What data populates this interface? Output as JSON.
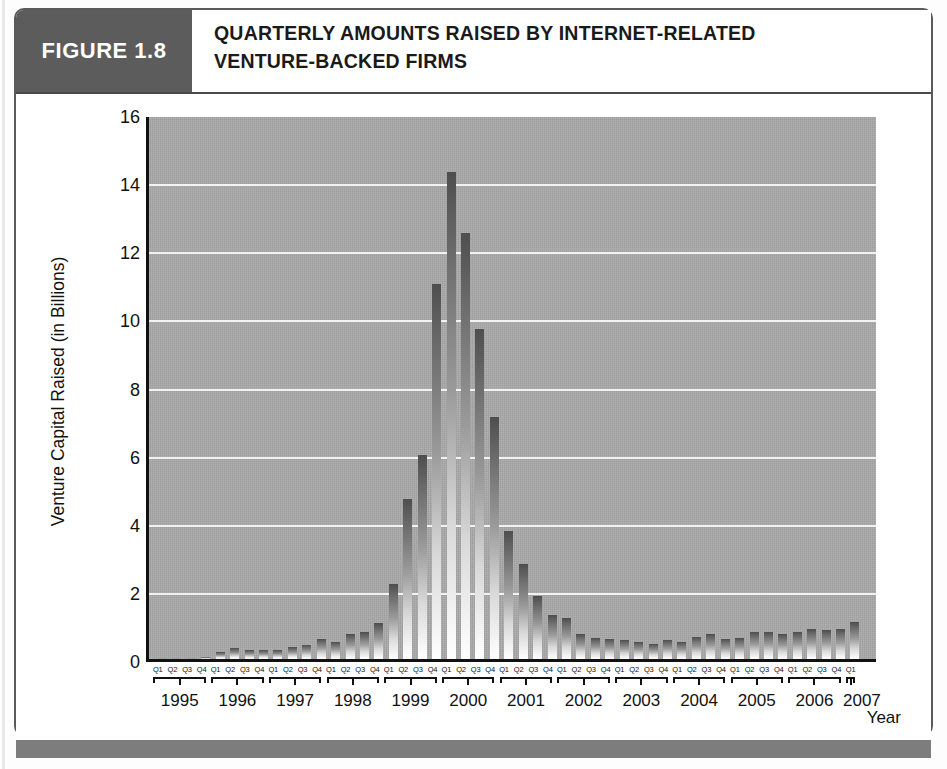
{
  "figure": {
    "tag": "FIGURE 1.8",
    "title_line1": "QUARTERLY AMOUNTS RAISED BY INTERNET-RELATED",
    "title_line2": "VENTURE-BACKED FIRMS"
  },
  "colors": {
    "tag_background": "#5c5c5c",
    "plot_background": "#a9a9a9",
    "gridline": "#f2f2f2",
    "bar_top": "#4e4e4e",
    "bar_bottom": "#ffffff",
    "axis": "#111111",
    "footer_band": "#7d7d7d"
  },
  "chart_data": {
    "type": "bar",
    "title": "Quarterly Amounts Raised by Internet-Related Venture-Backed Firms",
    "xlabel": "Year",
    "ylabel": "Venture Capital Raised (in Billions)",
    "ylim": [
      0,
      16
    ],
    "yticks": [
      0,
      2,
      4,
      6,
      8,
      10,
      12,
      14,
      16
    ],
    "grid": true,
    "legend": "none",
    "quarter_labels": [
      "Q1",
      "Q2",
      "Q3",
      "Q4"
    ],
    "years": [
      "1995",
      "1996",
      "1997",
      "1998",
      "1999",
      "2000",
      "2001",
      "2002",
      "2003",
      "2004",
      "2005",
      "2006",
      "2007"
    ],
    "categories": [
      "1995 Q1",
      "1995 Q2",
      "1995 Q3",
      "1995 Q4",
      "1996 Q1",
      "1996 Q2",
      "1996 Q3",
      "1996 Q4",
      "1997 Q1",
      "1997 Q2",
      "1997 Q3",
      "1997 Q4",
      "1998 Q1",
      "1998 Q2",
      "1998 Q3",
      "1998 Q4",
      "1999 Q1",
      "1999 Q2",
      "1999 Q3",
      "1999 Q4",
      "2000 Q1",
      "2000 Q2",
      "2000 Q3",
      "2000 Q4",
      "2001 Q1",
      "2001 Q2",
      "2001 Q3",
      "2001 Q4",
      "2002 Q1",
      "2002 Q2",
      "2002 Q3",
      "2002 Q4",
      "2003 Q1",
      "2003 Q2",
      "2003 Q3",
      "2003 Q4",
      "2004 Q1",
      "2004 Q2",
      "2004 Q3",
      "2004 Q4",
      "2005 Q1",
      "2005 Q2",
      "2005 Q3",
      "2005 Q4",
      "2006 Q1",
      "2006 Q2",
      "2006 Q3",
      "2006 Q4",
      "2007 Q1"
    ],
    "values": [
      0.02,
      0.03,
      0.04,
      0.05,
      0.22,
      0.32,
      0.26,
      0.26,
      0.25,
      0.34,
      0.42,
      0.58,
      0.5,
      0.72,
      0.78,
      1.05,
      2.2,
      4.7,
      6.0,
      11.0,
      14.3,
      12.5,
      9.7,
      7.1,
      3.75,
      2.8,
      1.85,
      1.3,
      1.2,
      0.72,
      0.62,
      0.58,
      0.55,
      0.5,
      0.45,
      0.55,
      0.5,
      0.65,
      0.72,
      0.6,
      0.62,
      0.78,
      0.8,
      0.72,
      0.78,
      0.88,
      0.85,
      0.88,
      1.1
    ]
  },
  "axis": {
    "y_title": "Venture Capital Raised (in Billions)",
    "x_title": "Year"
  }
}
